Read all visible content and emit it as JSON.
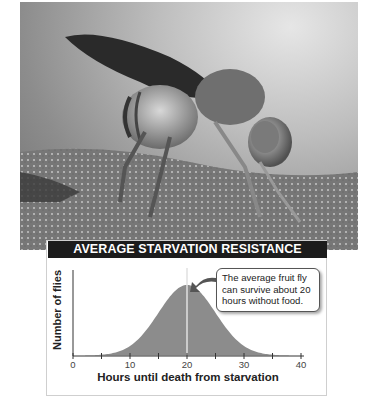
{
  "photo": {
    "subject": "fruit-fly-photo"
  },
  "chart_data": {
    "type": "area",
    "title": "AVERAGE STARVATION RESISTANCE",
    "xlabel": "Hours until death from starvation",
    "ylabel": "Number of flies",
    "xlim": [
      0,
      40
    ],
    "xticks": [
      0,
      5,
      10,
      15,
      20,
      25,
      30,
      35,
      40
    ],
    "xtick_labels": [
      "0",
      "10",
      "20",
      "30",
      "40"
    ],
    "distribution": "normal",
    "mean": 20,
    "std_dev": 5,
    "x": [
      0,
      4,
      6,
      8,
      10,
      12,
      14,
      16,
      18,
      20,
      22,
      24,
      26,
      28,
      30,
      32,
      34,
      36,
      40
    ],
    "values": [
      0,
      0.04,
      0.08,
      0.14,
      0.24,
      0.38,
      0.56,
      0.75,
      0.92,
      1.0,
      0.92,
      0.75,
      0.56,
      0.38,
      0.24,
      0.14,
      0.08,
      0.04,
      0
    ],
    "annotation": {
      "text": "The average fruit fly can survive about 20 hours without food.",
      "points_to_x": 20
    },
    "fill_color": "#8c8c8c",
    "mean_line_color": "#e0e0e0",
    "grid": false
  },
  "callout": {
    "line1": "The average fruit fly",
    "line2": "can survive about 20",
    "line3": "hours without food."
  },
  "ticks": {
    "t0": "0",
    "t10": "10",
    "t20": "20",
    "t30": "30",
    "t40": "40"
  }
}
